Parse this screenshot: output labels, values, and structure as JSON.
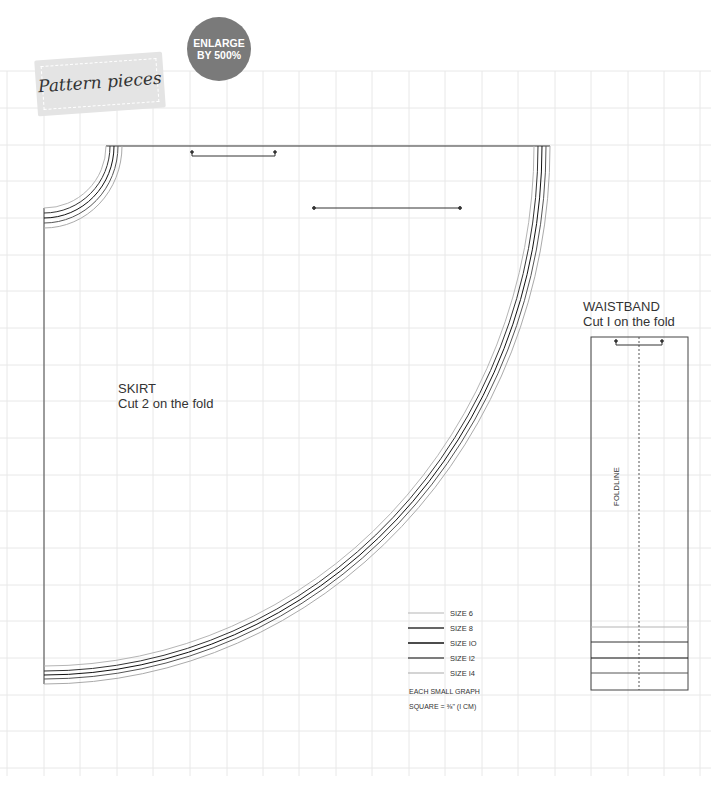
{
  "header": {
    "title": "Pattern pieces",
    "badge_line1": "ENLARGE",
    "badge_line2": "BY 500%"
  },
  "skirt": {
    "name": "SKIRT",
    "instruction": "Cut 2 on the fold"
  },
  "waistband": {
    "name": "WAISTBAND",
    "instruction": "Cut I on the fold",
    "foldline_label": "FOLDLINE"
  },
  "legend": {
    "items": [
      {
        "label": "SIZE 6",
        "color": "#b5b5b5"
      },
      {
        "label": "SIZE 8",
        "color": "#333333"
      },
      {
        "label": "SIZE IO",
        "color": "#111111"
      },
      {
        "label": "SIZE I2",
        "color": "#555555"
      },
      {
        "label": "SIZE I4",
        "color": "#aaaaaa"
      }
    ],
    "note_line1": "EACH SMALL GRAPH",
    "note_line2": "SQUARE = ⅜\" (I CM)"
  },
  "colors": {
    "grid": "#e6e6e6",
    "badge": "#7a7a7a",
    "tag": "#e4e4e4"
  }
}
